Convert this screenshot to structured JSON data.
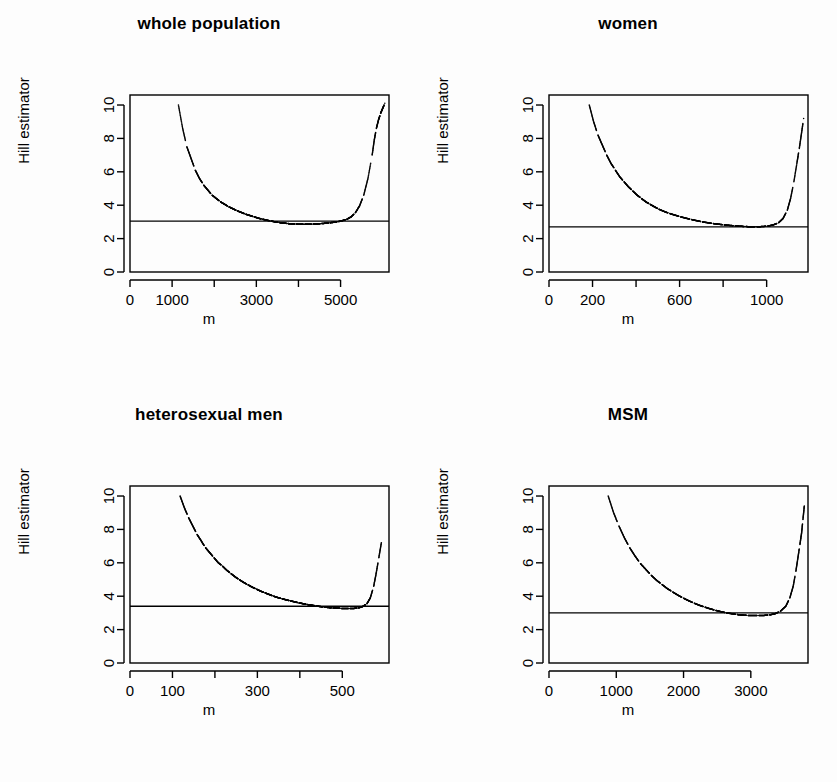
{
  "figure": {
    "background": "#fdfdfd",
    "ink": "#000000",
    "layout": "2x2 grid of panels"
  },
  "chart_data": [
    {
      "type": "line",
      "title": "whole population",
      "xlabel": "m",
      "ylabel": "Hill estimator",
      "xlim": [
        0,
        6150
      ],
      "ylim": [
        0,
        10.6
      ],
      "xticks": [
        0,
        1000,
        2000,
        3000,
        4000,
        5000
      ],
      "xticklabels": [
        "0",
        "1000",
        "",
        "3000",
        "",
        "5000"
      ],
      "yticks": [
        0,
        2,
        4,
        6,
        8,
        10
      ],
      "yticklabels": [
        "0",
        "2",
        "4",
        "6",
        "8",
        "10"
      ],
      "grid": false,
      "legend": "none",
      "hline": 3.05,
      "hline_label": "reference tail index estimate",
      "annotations": [],
      "series": [
        {
          "name": "Hill estimator path",
          "comment": "broken decreasing curve segments, minimum near m=4000, sharp rise at right edge",
          "x": [
            1150,
            1250,
            1350,
            1450,
            1550,
            1650,
            1750,
            1850,
            1950,
            2050,
            2150,
            2250,
            2350,
            2450,
            2550,
            2650,
            2750,
            2850,
            2950,
            3050,
            3150,
            3250,
            3350,
            3450,
            3550,
            3650,
            3750,
            3850,
            3950,
            4050,
            4150,
            4250,
            4350,
            4450,
            4550,
            4650,
            4750,
            4850,
            4950,
            5050,
            5150,
            5250,
            5350,
            5450,
            5550,
            5650,
            5750,
            5800,
            5850,
            5900,
            5950,
            6000,
            6050
          ],
          "y": [
            10.0,
            8.6,
            7.5,
            6.8,
            6.1,
            5.6,
            5.2,
            4.9,
            4.6,
            4.4,
            4.2,
            4.05,
            3.9,
            3.78,
            3.66,
            3.56,
            3.46,
            3.38,
            3.3,
            3.22,
            3.16,
            3.1,
            3.05,
            3.0,
            2.96,
            2.93,
            2.9,
            2.88,
            2.87,
            2.86,
            2.86,
            2.86,
            2.87,
            2.88,
            2.9,
            2.92,
            2.95,
            2.98,
            3.02,
            3.08,
            3.16,
            3.3,
            3.55,
            3.95,
            4.6,
            5.6,
            7.0,
            7.9,
            8.6,
            9.1,
            9.5,
            9.8,
            10.1
          ]
        }
      ]
    },
    {
      "type": "line",
      "title": "women",
      "xlabel": "m",
      "ylabel": "Hill estimator",
      "xlim": [
        0,
        1190
      ],
      "ylim": [
        0,
        10.6
      ],
      "xticks": [
        0,
        200,
        400,
        600,
        800,
        1000
      ],
      "xticklabels": [
        "0",
        "200",
        "",
        "600",
        "",
        "1000"
      ],
      "yticks": [
        0,
        2,
        4,
        6,
        8,
        10
      ],
      "yticklabels": [
        "0",
        "2",
        "4",
        "6",
        "8",
        "10"
      ],
      "grid": false,
      "legend": "none",
      "hline": 2.7,
      "hline_label": "reference tail index estimate",
      "annotations": [],
      "series": [
        {
          "name": "Hill estimator path",
          "comment": "broken decreasing curve segments, minimum near m=950, sharp rise at right edge",
          "x": [
            185,
            205,
            225,
            245,
            265,
            285,
            305,
            325,
            345,
            365,
            385,
            405,
            425,
            445,
            465,
            485,
            505,
            530,
            555,
            580,
            605,
            630,
            655,
            680,
            705,
            730,
            755,
            780,
            805,
            830,
            855,
            880,
            905,
            930,
            955,
            980,
            1005,
            1030,
            1055,
            1075,
            1095,
            1110,
            1125,
            1140,
            1150,
            1160,
            1170
          ],
          "y": [
            10.0,
            9.0,
            8.2,
            7.6,
            7.0,
            6.5,
            6.1,
            5.7,
            5.4,
            5.1,
            4.85,
            4.6,
            4.4,
            4.2,
            4.05,
            3.9,
            3.76,
            3.62,
            3.5,
            3.4,
            3.3,
            3.22,
            3.14,
            3.07,
            3.0,
            2.95,
            2.9,
            2.86,
            2.82,
            2.79,
            2.76,
            2.74,
            2.72,
            2.71,
            2.71,
            2.72,
            2.75,
            2.82,
            2.95,
            3.2,
            3.7,
            4.4,
            5.4,
            6.6,
            7.4,
            8.3,
            9.2
          ]
        }
      ]
    },
    {
      "type": "line",
      "title": "heterosexual men",
      "xlabel": "m",
      "ylabel": "Hill estimator",
      "xlim": [
        0,
        610
      ],
      "ylim": [
        0,
        10.6
      ],
      "xticks": [
        0,
        100,
        200,
        300,
        400,
        500
      ],
      "xticklabels": [
        "0",
        "100",
        "",
        "300",
        "",
        "500"
      ],
      "yticks": [
        0,
        2,
        4,
        6,
        8,
        10
      ],
      "yticklabels": [
        "0",
        "2",
        "4",
        "6",
        "8",
        "10"
      ],
      "grid": false,
      "legend": "none",
      "hline": 3.4,
      "hline_label": "reference tail index estimate",
      "annotations": [],
      "series": [
        {
          "name": "Hill estimator path",
          "comment": "broken decreasing curve segments, minimum near m=480, sharp rise at right edge",
          "x": [
            118,
            128,
            138,
            148,
            158,
            168,
            178,
            188,
            198,
            208,
            218,
            228,
            238,
            248,
            258,
            268,
            278,
            288,
            298,
            308,
            318,
            328,
            338,
            348,
            358,
            368,
            378,
            388,
            398,
            408,
            418,
            428,
            438,
            448,
            458,
            468,
            478,
            488,
            498,
            508,
            518,
            528,
            538,
            548,
            558,
            566,
            574,
            580,
            586,
            592
          ],
          "y": [
            10.0,
            9.3,
            8.7,
            8.2,
            7.7,
            7.3,
            6.9,
            6.6,
            6.3,
            6.0,
            5.8,
            5.55,
            5.35,
            5.15,
            4.98,
            4.82,
            4.68,
            4.54,
            4.42,
            4.3,
            4.2,
            4.1,
            4.0,
            3.92,
            3.85,
            3.78,
            3.72,
            3.66,
            3.6,
            3.55,
            3.5,
            3.46,
            3.42,
            3.38,
            3.35,
            3.32,
            3.3,
            3.28,
            3.27,
            3.26,
            3.26,
            3.27,
            3.3,
            3.38,
            3.55,
            3.9,
            4.6,
            5.4,
            6.3,
            7.2
          ]
        }
      ]
    },
    {
      "type": "line",
      "title": "MSM",
      "xlabel": "m",
      "ylabel": "Hill estimator",
      "xlim": [
        0,
        3850
      ],
      "ylim": [
        0,
        10.6
      ],
      "xticks": [
        0,
        1000,
        2000,
        3000
      ],
      "xticklabels": [
        "0",
        "1000",
        "2000",
        "3000"
      ],
      "yticks": [
        0,
        2,
        4,
        6,
        8,
        10
      ],
      "yticklabels": [
        "0",
        "2",
        "4",
        "6",
        "8",
        "10"
      ],
      "grid": false,
      "legend": "none",
      "hline": 3.0,
      "hline_label": "reference tail index estimate",
      "annotations": [],
      "series": [
        {
          "name": "Hill estimator path",
          "comment": "broken decreasing curve segments, minimum near m=2700, sharp rise at right edge",
          "x": [
            880,
            960,
            1040,
            1120,
            1200,
            1280,
            1360,
            1440,
            1520,
            1600,
            1680,
            1760,
            1840,
            1920,
            2000,
            2080,
            2160,
            2240,
            2320,
            2400,
            2480,
            2560,
            2640,
            2720,
            2800,
            2880,
            2960,
            3040,
            3120,
            3200,
            3280,
            3360,
            3440,
            3520,
            3580,
            3630,
            3670,
            3700,
            3730,
            3755,
            3775,
            3795
          ],
          "y": [
            10.0,
            9.0,
            8.2,
            7.5,
            6.9,
            6.4,
            5.95,
            5.6,
            5.25,
            4.95,
            4.7,
            4.45,
            4.25,
            4.05,
            3.88,
            3.72,
            3.58,
            3.45,
            3.34,
            3.24,
            3.15,
            3.07,
            3.0,
            2.95,
            2.9,
            2.87,
            2.85,
            2.84,
            2.84,
            2.85,
            2.88,
            2.95,
            3.1,
            3.4,
            3.9,
            4.6,
            5.5,
            6.3,
            7.1,
            7.8,
            8.6,
            9.4
          ]
        }
      ]
    }
  ],
  "panels": [
    {
      "id": "whole-population",
      "title": "whole population",
      "xlabel": "m",
      "ylabel": "Hill estimator",
      "position": "top-left"
    },
    {
      "id": "women",
      "title": "women",
      "xlabel": "m",
      "ylabel": "Hill estimator",
      "position": "top-right"
    },
    {
      "id": "heterosexual-men",
      "title": "heterosexual men",
      "xlabel": "m",
      "ylabel": "Hill estimator",
      "position": "bottom-left"
    },
    {
      "id": "msm",
      "title": "MSM",
      "xlabel": "m",
      "ylabel": "Hill estimator",
      "position": "bottom-right"
    }
  ]
}
